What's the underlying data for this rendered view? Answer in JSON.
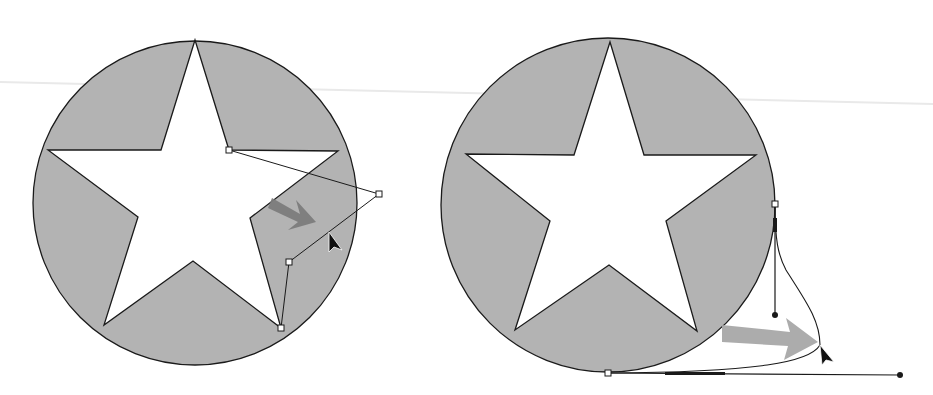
{
  "colors": {
    "background": "#ffffff",
    "circle_fill": "#b3b3b3",
    "star_fill": "#ffffff",
    "stroke": "#1a1a1a",
    "arrow_left": "#7c7c7c",
    "arrow_right": "#a8a8a8",
    "cursor": "#111111",
    "scan_line": "#e9e9e9"
  },
  "panels": [
    {
      "name": "before",
      "circle": {
        "cx": 195,
        "cy": 203,
        "r": 162
      },
      "star": "195,40 229,150 338,151 250,218 281,328 193,261 104,325 138,217 48,150 161,150",
      "path": "M229,150 L379,194 L289,262 L281,328",
      "anchors": [
        [
          229,
          150
        ],
        [
          379,
          194
        ],
        [
          289,
          262
        ],
        [
          281,
          328
        ]
      ],
      "drag_arrow": "M272,198 L300,214 L296,200 L316,222 L288,230 L298,222 L268,208 Z",
      "cursor": "M329,232 L329,252 L334,247 L342,250 Z"
    },
    {
      "name": "after",
      "circle": {
        "cx": 608,
        "cy": 205,
        "r": 167
      },
      "star": "610,42 644,155 756,155 666,221 697,331 609,265 515,330 550,221 466,154 574,155",
      "curve": "M775,204 C775,240 778,255 786,270 C805,300 820,320 820,345 C810,362 760,372 608,373",
      "handle_lines": [
        {
          "x1": 775,
          "y1": 204,
          "x2": 775,
          "y2": 315
        },
        {
          "x1": 608,
          "y1": 373,
          "x2": 900,
          "y2": 375
        }
      ],
      "handle_bar": {
        "x": 773,
        "y": 218,
        "w": 4,
        "h": 14
      },
      "handle_bar2": {
        "x": 665,
        "y": 372,
        "w": 60,
        "h": 3
      },
      "anchors": [
        [
          775,
          204
        ],
        [
          608,
          373
        ]
      ],
      "handle_dots": [
        [
          775,
          315
        ],
        [
          900,
          375
        ]
      ],
      "drag_arrow": "M722,325 L790,332 L786,318 L818,342 L784,360 L788,346 L722,342 Z",
      "cursor": "M820,345 L822,365 L826,360 L834,362 Z"
    }
  ]
}
